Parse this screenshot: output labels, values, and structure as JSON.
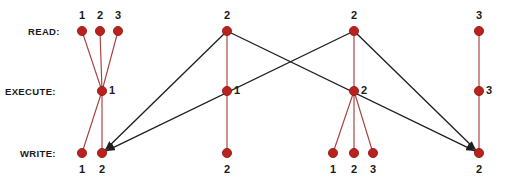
{
  "diagram": {
    "background": "#ffffff",
    "node_color": "#b9231f",
    "node_edge_color": "#8d1411",
    "intra_edge_color": "#a8413c",
    "inter_edge_color": "#1f1f1f",
    "node_radius": 4.6,
    "rows": [
      {
        "key": "read",
        "label": "READ:",
        "y": 31,
        "label_x": 28,
        "label_anchor": "end"
      },
      {
        "key": "execute",
        "label": "EXECUTE:",
        "y": 91,
        "label_x": 5,
        "label_anchor": "start"
      },
      {
        "key": "write",
        "label": "WRITE:",
        "y": 153,
        "label_x": 20,
        "label_anchor": "start"
      }
    ],
    "nodes": [
      {
        "id": "r1a",
        "row": "read",
        "x": 82,
        "y": 31,
        "label": "1",
        "label_pos": "above"
      },
      {
        "id": "r1b",
        "row": "read",
        "x": 100,
        "y": 31,
        "label": "2",
        "label_pos": "above"
      },
      {
        "id": "r1c",
        "row": "read",
        "x": 118,
        "y": 31,
        "label": "3",
        "label_pos": "above"
      },
      {
        "id": "e1",
        "row": "execute",
        "x": 102,
        "y": 91,
        "label": "1",
        "label_pos": "right"
      },
      {
        "id": "w1a",
        "row": "write",
        "x": 82,
        "y": 153,
        "label": "1",
        "label_pos": "below"
      },
      {
        "id": "w1b",
        "row": "write",
        "x": 102,
        "y": 153,
        "label": "2",
        "label_pos": "below"
      },
      {
        "id": "r2",
        "row": "read",
        "x": 227,
        "y": 31,
        "label": "2",
        "label_pos": "above"
      },
      {
        "id": "e2",
        "row": "execute",
        "x": 227,
        "y": 91,
        "label": "1",
        "label_pos": "right"
      },
      {
        "id": "w2",
        "row": "write",
        "x": 227,
        "y": 153,
        "label": "2",
        "label_pos": "below"
      },
      {
        "id": "r3",
        "row": "read",
        "x": 354,
        "y": 31,
        "label": "2",
        "label_pos": "above"
      },
      {
        "id": "e3",
        "row": "execute",
        "x": 354,
        "y": 91,
        "label": "2",
        "label_pos": "right"
      },
      {
        "id": "w3a",
        "row": "write",
        "x": 333,
        "y": 153,
        "label": "1",
        "label_pos": "below"
      },
      {
        "id": "w3b",
        "row": "write",
        "x": 354,
        "y": 153,
        "label": "2",
        "label_pos": "below"
      },
      {
        "id": "w3c",
        "row": "write",
        "x": 373,
        "y": 153,
        "label": "3",
        "label_pos": "below"
      },
      {
        "id": "r4",
        "row": "read",
        "x": 479,
        "y": 31,
        "label": "3",
        "label_pos": "above"
      },
      {
        "id": "e4",
        "row": "execute",
        "x": 479,
        "y": 91,
        "label": "3",
        "label_pos": "right"
      },
      {
        "id": "w4",
        "row": "write",
        "x": 479,
        "y": 153,
        "label": "2",
        "label_pos": "below"
      }
    ],
    "intra_edges": [
      {
        "from": "r1a",
        "to": "e1"
      },
      {
        "from": "r1b",
        "to": "e1"
      },
      {
        "from": "r1c",
        "to": "e1"
      },
      {
        "from": "e1",
        "to": "w1a"
      },
      {
        "from": "e1",
        "to": "w1b"
      },
      {
        "from": "r2",
        "to": "e2"
      },
      {
        "from": "e2",
        "to": "w2"
      },
      {
        "from": "r3",
        "to": "e3"
      },
      {
        "from": "e3",
        "to": "w3a"
      },
      {
        "from": "e3",
        "to": "w3b"
      },
      {
        "from": "e3",
        "to": "w3c"
      },
      {
        "from": "r4",
        "to": "e4"
      },
      {
        "from": "e4",
        "to": "w4"
      }
    ],
    "inter_edges": [
      {
        "from": "r2",
        "to": "w1b",
        "arrow": true
      },
      {
        "from": "r3",
        "to": "w1b",
        "arrow": true
      },
      {
        "from": "r2",
        "to": "w4",
        "arrow": true
      },
      {
        "from": "r3",
        "to": "w4",
        "arrow": true
      }
    ]
  }
}
